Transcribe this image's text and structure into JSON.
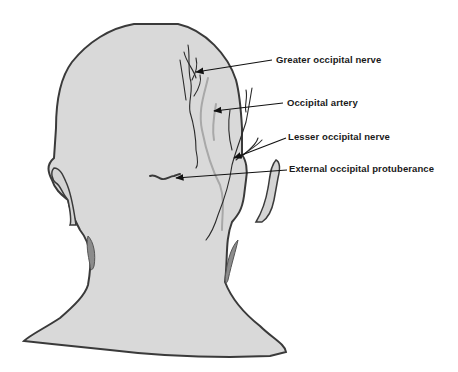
{
  "figure": {
    "colors": {
      "skin": "#d9d9d9",
      "outline": "#3a3a3a",
      "shadow": "#8c8c8c",
      "nerve": "#2b2b2b",
      "artery": "#a8a8a8",
      "leader": "#111111"
    },
    "labels": [
      {
        "id": "greater-occipital-nerve",
        "text": "Greater occipital nerve"
      },
      {
        "id": "occipital-artery",
        "text": "Occipital artery"
      },
      {
        "id": "lesser-occipital-nerve",
        "text": "Lesser occipital nerve"
      },
      {
        "id": "external-occipital-protuberance",
        "text": "External occipital protuberance"
      }
    ]
  }
}
